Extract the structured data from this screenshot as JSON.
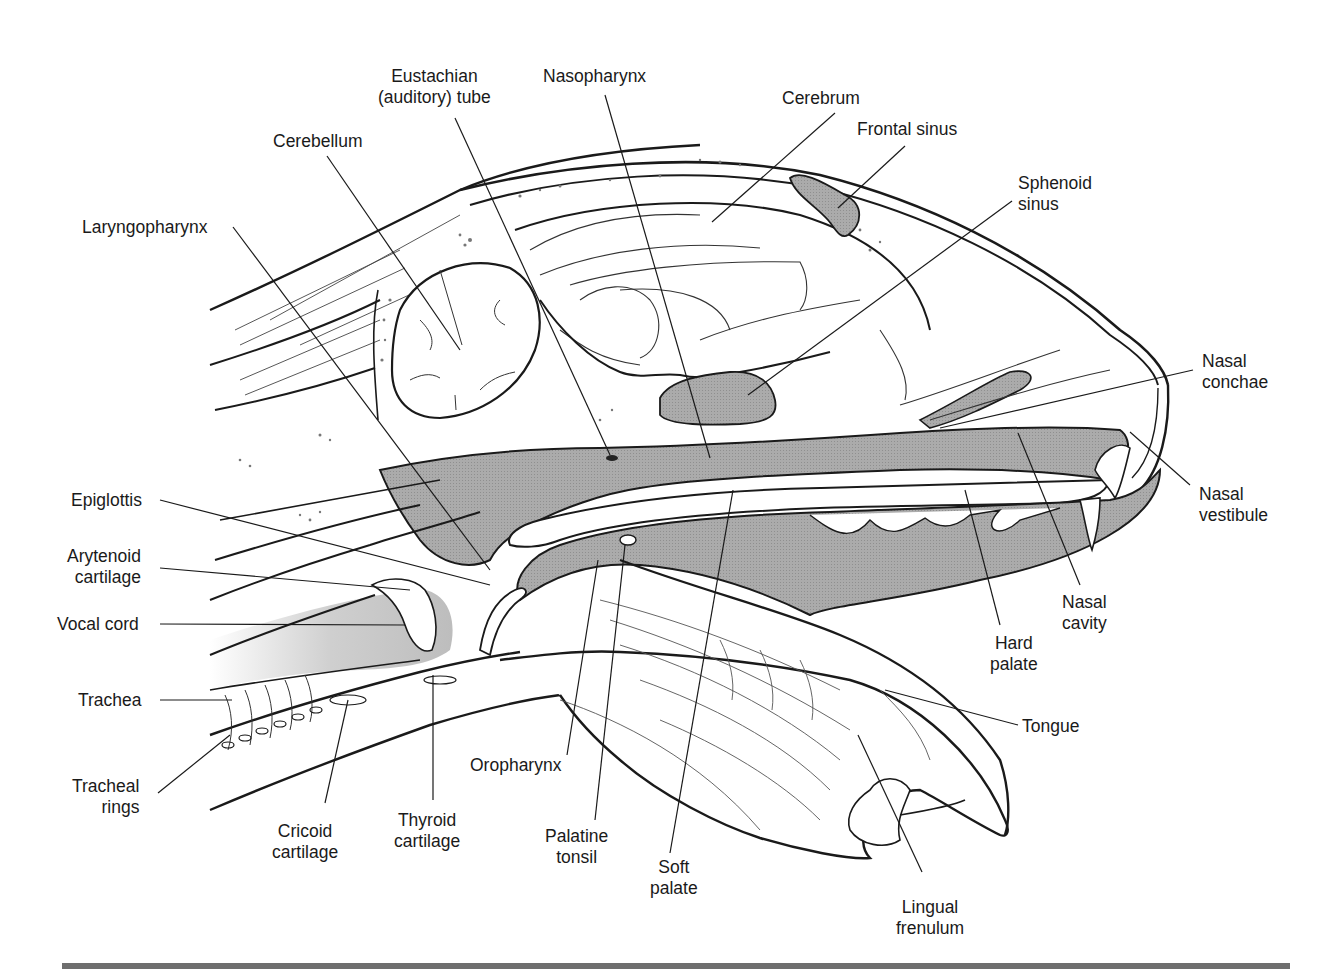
{
  "figure": {
    "colors": {
      "outline": "#1a1a1a",
      "shaded_cavity": "#a9a9a9",
      "light_shade": "#d6d6d6",
      "background": "#ffffff",
      "bottom_rule": "#6e6e6e"
    }
  },
  "labels": {
    "eustachian_tube": "Eustachian\n(auditory) tube",
    "nasopharynx": "Nasopharynx",
    "cerebrum": "Cerebrum",
    "frontal_sinus": "Frontal sinus",
    "cerebellum": "Cerebellum",
    "sphenoid_sinus": "Sphenoid\nsinus",
    "laryngopharynx": "Laryngopharynx",
    "nasal_conchae": "Nasal\nconchae",
    "nasal_vestibule": "Nasal\nvestibule",
    "epiglottis": "Epiglottis",
    "arytenoid_cartilage": "Arytenoid\ncartilage",
    "vocal_cord": "Vocal cord",
    "nasal_cavity": "Nasal\ncavity",
    "hard_palate": "Hard\npalate",
    "trachea": "Trachea",
    "tongue": "Tongue",
    "oropharynx": "Oropharynx",
    "tracheal_rings": "Tracheal\nrings",
    "cricoid_cartilage": "Cricoid\ncartilage",
    "thyroid_cartilage": "Thyroid\ncartilage",
    "palatine_tonsil": "Palatine\ntonsil",
    "soft_palate": "Soft\npalate",
    "lingual_frenulum": "Lingual\nfrenulum"
  }
}
